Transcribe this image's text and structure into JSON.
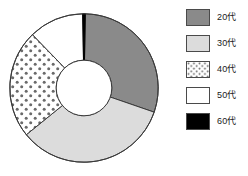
{
  "chart_data": {
    "type": "pie",
    "variant": "donut",
    "title": "",
    "subtitle": "",
    "xlabel": "",
    "ylabel": "",
    "legend_position": "right",
    "grid": false,
    "categories": [
      "20代",
      "30代",
      "40代",
      "50代",
      "60代"
    ],
    "values": [
      30,
      33.5,
      23.5,
      12,
      1
    ],
    "units": "percent",
    "start_angle_deg": 0,
    "direction": "clockwise",
    "inner_radius_ratio": 0.375,
    "slices": [
      {
        "label": "20代",
        "value": 30,
        "start_deg": 1,
        "end_deg": 109,
        "fill": "#8a8a8a",
        "pattern": "solid",
        "stroke": "#3a3a3a"
      },
      {
        "label": "30代",
        "value": 33.5,
        "start_deg": 109,
        "end_deg": 231,
        "fill": "#dcdcdc",
        "pattern": "solid",
        "stroke": "#3a3a3a"
      },
      {
        "label": "40代",
        "value": 23.5,
        "start_deg": 231,
        "end_deg": 316,
        "fill": "#ffffff",
        "pattern": "dots",
        "stroke": "#3a3a3a"
      },
      {
        "label": "50代",
        "value": 12,
        "start_deg": 316,
        "end_deg": 359,
        "fill": "#ffffff",
        "pattern": "solid",
        "stroke": "#3a3a3a"
      },
      {
        "label": "60代",
        "value": 1,
        "start_deg": 359,
        "end_deg": 361,
        "fill": "#000000",
        "pattern": "solid",
        "stroke": "#000000"
      }
    ]
  },
  "legend": {
    "items": [
      {
        "label": "20代",
        "swatch_fill": "#8a8a8a",
        "swatch_pattern": "solid",
        "swatch_border": "#4a4a4a"
      },
      {
        "label": "30代",
        "swatch_fill": "#dcdcdc",
        "swatch_pattern": "solid",
        "swatch_border": "#4a4a4a"
      },
      {
        "label": "40代",
        "swatch_fill": "#ffffff",
        "swatch_pattern": "dots",
        "swatch_border": "#4a4a4a"
      },
      {
        "label": "50代",
        "swatch_fill": "#ffffff",
        "swatch_pattern": "solid",
        "swatch_border": "#4a4a4a"
      },
      {
        "label": "60代",
        "swatch_fill": "#000000",
        "swatch_pattern": "solid",
        "swatch_border": "#000000"
      }
    ]
  },
  "colors": {
    "background": "#ffffff",
    "outline": "#3a3a3a",
    "text": "#1a1a1a",
    "dot": "#6a6a6a"
  }
}
